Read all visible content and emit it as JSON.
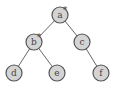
{
  "diagram": {
    "type": "tree",
    "nodes": [
      {
        "id": "a",
        "label": "a",
        "marked": true,
        "x": 60,
        "y": 15
      },
      {
        "id": "b",
        "label": "b",
        "marked": true,
        "x": 34,
        "y": 42
      },
      {
        "id": "c",
        "label": "c",
        "marked": false,
        "x": 82,
        "y": 42
      },
      {
        "id": "d",
        "label": "d",
        "marked": false,
        "x": 14,
        "y": 73
      },
      {
        "id": "e",
        "label": "e",
        "marked": false,
        "x": 57,
        "y": 73
      },
      {
        "id": "f",
        "label": "f",
        "marked": false,
        "x": 101,
        "y": 73
      }
    ],
    "edges": [
      {
        "from": "a",
        "to": "b"
      },
      {
        "from": "a",
        "to": "c"
      },
      {
        "from": "b",
        "to": "d"
      },
      {
        "from": "b",
        "to": "e"
      },
      {
        "from": "c",
        "to": "f"
      }
    ],
    "mark_symbol": "*"
  }
}
